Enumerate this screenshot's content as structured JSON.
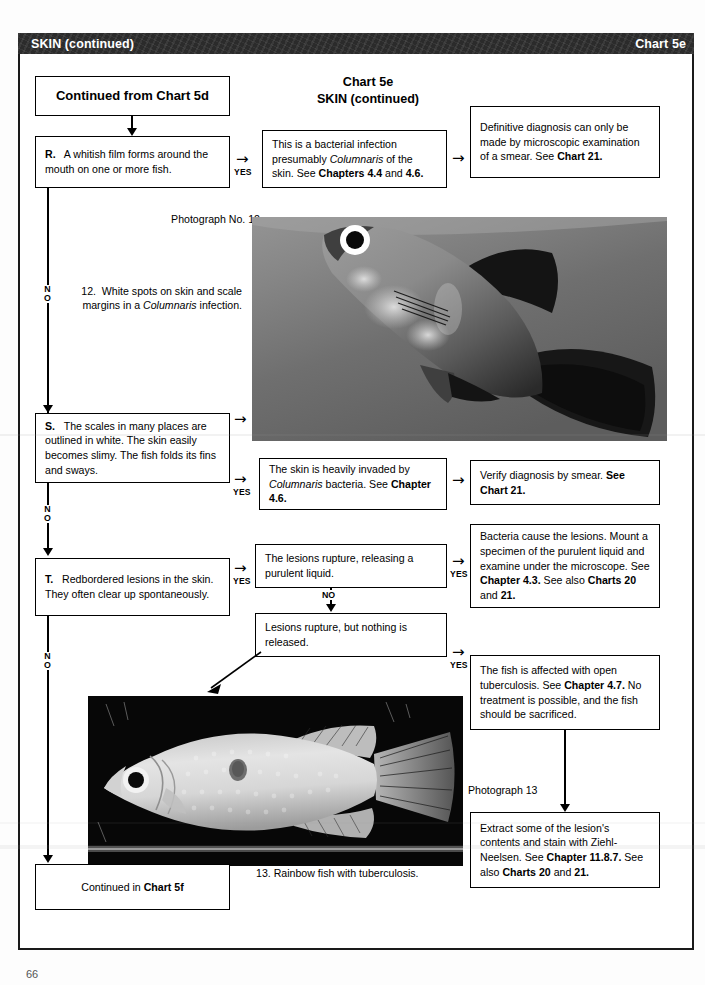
{
  "header": {
    "title": "SKIN (continued)",
    "chart_label": "Chart 5e"
  },
  "chart_title": {
    "line1": "Chart 5e",
    "line2": "SKIN (continued)"
  },
  "boxes": {
    "continued_from": "Continued from Chart 5d",
    "question_r": "R.   A whitish film forms around the mouth on one or more fish.",
    "answer_r": "This is a bacterial infection presumably Columnaris of the skin. See Chapters 4.4 and 4.6.",
    "result_r": "Definitive diagnosis can only be made by microscopic examination of a smear. See Chart 21.",
    "question_s": "S.   The scales in many places are outlined in white. The skin easily becomes slimy. The fish folds its fins and sways.",
    "answer_s": "The skin is heavily invaded by Columnaris bacteria. See Chapter 4.6.",
    "result_s": "Verify diagnosis by smear. See Chart 21.",
    "question_t": "T.   Redbordered lesions in the skin. They often clear up spontaneously.",
    "answer_t1": "The lesions  rupture, releasing a purulent liquid.",
    "result_t1": "Bacteria cause the lesions. Mount a specimen of the purulent liquid and examine under the microscope. See Chapter 4.3. See also Charts 20 and 21.",
    "answer_t2": "Lesions rupture, but nothing is released.",
    "result_t2": "The fish is affected with open tuberculosis. See Chapter 4.7. No treatment is possible, and the fish should be sacrificed.",
    "result_t3": "Extract some of the lesion's contents and stain with Ziehl-Neelsen. See Chapter 11.8.7. See also Charts 20 and 21.",
    "continued_in": "Continued in Chart 5f"
  },
  "photos": {
    "photo12_label": "Photograph No. 12",
    "photo12_caption": "12.  White spots on skin and scale margins in a Columnaris infection.",
    "photo13_label": "Photograph 13",
    "photo13_caption": "13.  Rainbow fish with tuberculosis."
  },
  "flow_labels": {
    "yes": "YES",
    "no": "NO",
    "no_v1": "N",
    "no_v2": "O"
  },
  "page_number": "66",
  "colors": {
    "header_bar": "#2b2b2b",
    "header_text": "#ffffff",
    "line": "#000000",
    "page_bg": "#ffffff"
  }
}
